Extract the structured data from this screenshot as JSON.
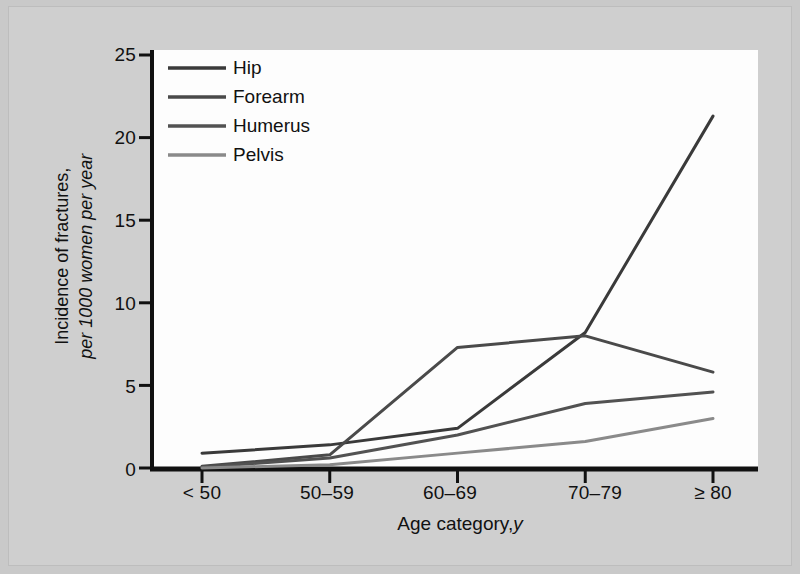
{
  "figure": {
    "background_color": "#c9c9c9",
    "plot_background_color": "#fdfdfd"
  },
  "chart_data": {
    "type": "line",
    "title": "",
    "xlabel": "Age category, y",
    "xlabel_plain": "Age category,",
    "xlabel_italic": "y",
    "ylabel_line1": "Incidence of fractures,",
    "ylabel_line2": "per 1000 women per year",
    "categories": [
      "< 50",
      "50–59",
      "60–69",
      "70–79",
      "≥ 80"
    ],
    "ylim": [
      0,
      25
    ],
    "yticks": [
      0,
      5,
      10,
      15,
      20,
      25
    ],
    "ytick_labels": [
      "0",
      "5",
      "10",
      "15",
      "20",
      "25"
    ],
    "grid": false,
    "legend_position": "top-left inside axes",
    "series": [
      {
        "name": "Hip",
        "color": "#3a3a3a",
        "values": [
          0.9,
          1.4,
          2.4,
          8.2,
          21.3
        ]
      },
      {
        "name": "Forearm",
        "color": "#4a4a4a",
        "values": [
          0.1,
          0.8,
          7.3,
          8.0,
          5.8
        ]
      },
      {
        "name": "Humerus",
        "color": "#525252",
        "values": [
          0.05,
          0.6,
          2.0,
          3.9,
          4.6
        ]
      },
      {
        "name": "Pelvis",
        "color": "#8a8a8a",
        "values": [
          0.0,
          0.2,
          0.9,
          1.6,
          3.0
        ]
      }
    ]
  },
  "legend": {
    "items": [
      {
        "label": "Hip",
        "color": "#3a3a3a"
      },
      {
        "label": "Forearm",
        "color": "#4a4a4a"
      },
      {
        "label": "Humerus",
        "color": "#525252"
      },
      {
        "label": "Pelvis",
        "color": "#8a8a8a"
      }
    ]
  }
}
